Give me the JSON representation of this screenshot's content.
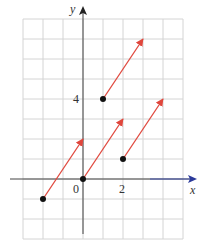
{
  "chart_data": {
    "type": "scatter",
    "title": "",
    "xlabel": "x",
    "ylabel": "y",
    "xlim": [
      -3,
      5
    ],
    "ylim": [
      -3,
      8
    ],
    "grid": true,
    "tick_labels": {
      "x": [
        {
          "value": 0,
          "label": "0"
        },
        {
          "value": 2,
          "label": "2"
        }
      ],
      "y": [
        {
          "value": 4,
          "label": "4"
        }
      ]
    },
    "points": [
      {
        "x": -2,
        "y": -1
      },
      {
        "x": 0,
        "y": 0
      },
      {
        "x": 1,
        "y": 4
      },
      {
        "x": 2,
        "y": 1
      }
    ],
    "vectors": [
      {
        "from": [
          -2,
          -1
        ],
        "to": [
          0,
          2
        ]
      },
      {
        "from": [
          0,
          0
        ],
        "to": [
          2,
          3
        ]
      },
      {
        "from": [
          1,
          4
        ],
        "to": [
          3,
          7
        ]
      },
      {
        "from": [
          2,
          1
        ],
        "to": [
          4,
          4
        ]
      }
    ],
    "vector": [
      2,
      3
    ],
    "colors": {
      "vector": "#e0463c",
      "point": "#111111",
      "grid": "#d4d4d4",
      "axis": "#444444",
      "x_axis_arrow": "#2b3a9a"
    }
  },
  "labels": {
    "x_axis": "x",
    "y_axis": "y",
    "origin": "0",
    "x_tick_2": "2",
    "y_tick_4": "4"
  }
}
